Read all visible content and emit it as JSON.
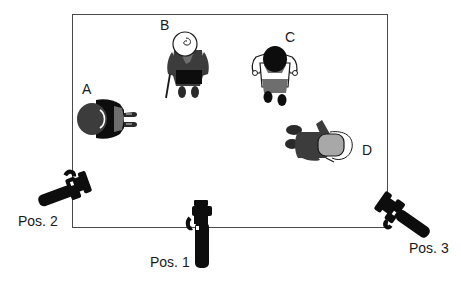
{
  "diagram": {
    "type": "top-down scene layout",
    "room": {
      "shape": "rectangle",
      "border_color": "#4a4a4a"
    },
    "persons": [
      {
        "id": "A",
        "label": "A",
        "description": "person seen from above, dark hair, facing right"
      },
      {
        "id": "B",
        "label": "B",
        "description": "elderly woman with white hair and walking cane, facing down"
      },
      {
        "id": "C",
        "label": "C",
        "description": "person with black hair and white shirt, facing down"
      },
      {
        "id": "D",
        "label": "D",
        "description": "person with light hair/cap, facing right-down"
      }
    ],
    "camera_positions": [
      {
        "id": "pos2",
        "label": "Pos. 2",
        "location": "left edge, lower"
      },
      {
        "id": "pos1",
        "label": "Pos. 1",
        "location": "bottom edge, center"
      },
      {
        "id": "pos3",
        "label": "Pos. 3",
        "location": "bottom-right corner"
      }
    ],
    "colors": {
      "ink": "#0d0d0d",
      "dark_gray": "#3c3c3c",
      "mid_gray": "#6e6e6e",
      "light_gray": "#a8a8a8",
      "white": "#ffffff"
    }
  }
}
